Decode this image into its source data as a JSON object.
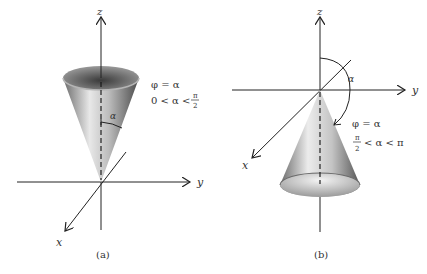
{
  "figure_a": {
    "caption": "(a)",
    "axis_labels": {
      "z": "z",
      "y": "y",
      "x": "x"
    },
    "angle_label": "α",
    "equation": "φ = α",
    "condition_left": "0 < α <",
    "condition_frac_num": "π",
    "condition_frac_den": "2"
  },
  "figure_b": {
    "caption": "(b)",
    "axis_labels": {
      "z": "z",
      "y": "y",
      "x": "x"
    },
    "angle_label": "α",
    "equation": "φ = α",
    "condition_frac_num": "π",
    "condition_frac_den": "2",
    "condition_right": "< α < π"
  },
  "colors": {
    "axis": "#222222",
    "text": "#333333",
    "cone_dark": "#555555",
    "cone_light": "#e6e6e6"
  }
}
